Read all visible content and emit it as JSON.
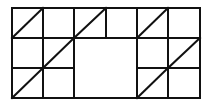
{
  "diagram": {
    "stroke_color": "#111111",
    "background": "#ffffff",
    "columns": 6,
    "rows": 3,
    "diagonals": [
      {
        "row": 0,
        "col": 0
      },
      {
        "row": 0,
        "col": 2
      },
      {
        "row": 0,
        "col": 4
      },
      {
        "row": 1,
        "col": 1
      },
      {
        "row": 1,
        "col": 5
      },
      {
        "row": 2,
        "col": 0
      },
      {
        "row": 2,
        "col": 4
      }
    ],
    "merged_cell": {
      "rows": [
        1,
        2
      ],
      "cols": [
        2,
        3
      ]
    }
  }
}
